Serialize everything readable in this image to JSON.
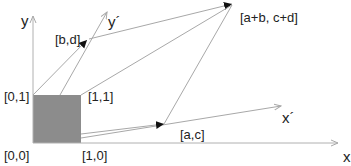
{
  "diagram": {
    "axes": {
      "x_label": "x",
      "y_label": "y",
      "x_prime_label": "x´",
      "y_prime_label": "y´"
    },
    "points": {
      "origin": "[0,0]",
      "e1": "[1,0]",
      "e2": "[0,1]",
      "e12": "[1,1]",
      "ac": "[a,c]",
      "bd": "[b,d]",
      "sum": "[a+b, c+d]"
    },
    "colors": {
      "square_fill": "#8c8c8c",
      "line": "#a8a8a8",
      "arrow_head": "#111111",
      "text": "#222222"
    }
  }
}
